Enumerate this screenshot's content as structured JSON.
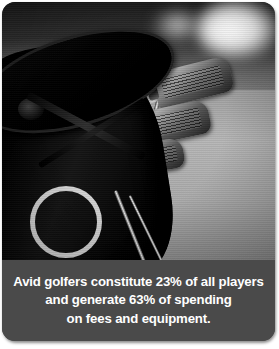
{
  "card": {
    "background_color": "#4a4a4a",
    "corner_radius_px": 13
  },
  "photo": {
    "alt_description": "Close-up black-and-white photograph of a golf bag with iron club heads on a fairway",
    "treatment": "grayscale",
    "subjects": [
      "golf-bag",
      "iron-club-heads",
      "club-shafts",
      "stand-legs",
      "towel"
    ]
  },
  "caption": {
    "background_color": "#4a4a4a",
    "text_color": "#ffffff",
    "lines": [
      "Avid golfers constitute 23% of all players",
      "and generate 63% of spending",
      "on fees and equipment."
    ],
    "full_text": "Avid golfers constitute 23% of all players and generate 63% of spending on fees and equipment.",
    "stats": {
      "share_of_all_players_percent": "23%",
      "share_of_spending_percent": "63%",
      "spending_categories": "fees and equipment"
    }
  }
}
